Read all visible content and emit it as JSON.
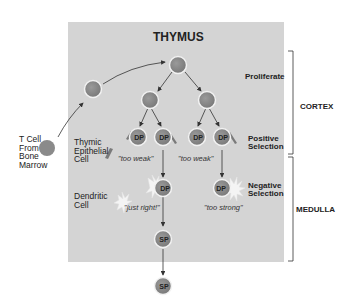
{
  "title": "THYMUS",
  "source": {
    "label_lines": [
      "T Cell",
      "From",
      "Bone",
      "Marrow"
    ]
  },
  "cell_types": {
    "epithelial_lines": [
      "Thymic",
      "Epithelial",
      "Cell"
    ],
    "dendritic_lines": [
      "Dendritic",
      "Cell"
    ]
  },
  "stages": {
    "proliferate": "Proliferate",
    "positive_selection_lines": [
      "Positive",
      "Selection"
    ],
    "negative_selection_lines": [
      "Negative",
      "Selection"
    ]
  },
  "regions": {
    "cortex": "CORTEX",
    "medulla": "MEDULLA"
  },
  "outcomes": {
    "too_weak_left": "\"too weak\"",
    "too_weak_right": "\"too weak\"",
    "just_right": "\"just right!\"",
    "too_strong": "\"too strong\""
  },
  "cell_labels": {
    "dp": "DP",
    "sp": "SP"
  },
  "colors": {
    "box": "#d4d4d4",
    "cell": "#8a8a8a",
    "cell_rim": "#f2f2f2",
    "arrow": "#333333",
    "text": "#222222"
  }
}
